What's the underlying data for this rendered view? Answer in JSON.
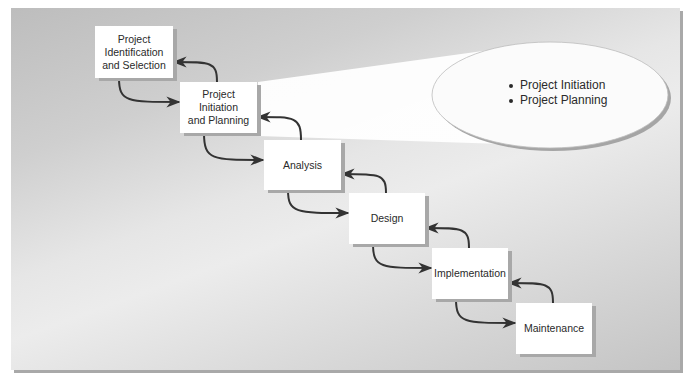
{
  "diagram": {
    "phases": [
      {
        "id": "p1",
        "label": "Project\nIdentification\nand Selection",
        "x": 95,
        "y": 26,
        "w": 78,
        "h": 52
      },
      {
        "id": "p2",
        "label": "Project\nInitiation\nand Planning",
        "x": 180,
        "y": 82,
        "w": 77,
        "h": 51
      },
      {
        "id": "p3",
        "label": "Analysis",
        "x": 264,
        "y": 140,
        "w": 77,
        "h": 50
      },
      {
        "id": "p4",
        "label": "Design",
        "x": 349,
        "y": 193,
        "w": 76,
        "h": 51
      },
      {
        "id": "p5",
        "label": "Implementation",
        "x": 432,
        "y": 248,
        "w": 76,
        "h": 51
      },
      {
        "id": "p6",
        "label": "Maintenance",
        "x": 516,
        "y": 303,
        "w": 76,
        "h": 51
      }
    ],
    "arrows": [
      {
        "from": "p1",
        "to": "p2",
        "direction": "forward"
      },
      {
        "from": "p2",
        "to": "p1",
        "direction": "backward"
      },
      {
        "from": "p2",
        "to": "p3",
        "direction": "forward"
      },
      {
        "from": "p3",
        "to": "p2",
        "direction": "backward"
      },
      {
        "from": "p3",
        "to": "p4",
        "direction": "forward"
      },
      {
        "from": "p4",
        "to": "p3",
        "direction": "backward"
      },
      {
        "from": "p4",
        "to": "p5",
        "direction": "forward"
      },
      {
        "from": "p5",
        "to": "p4",
        "direction": "backward"
      },
      {
        "from": "p5",
        "to": "p6",
        "direction": "forward"
      },
      {
        "from": "p6",
        "to": "p5",
        "direction": "backward"
      }
    ],
    "callout": {
      "attached_to": "p2",
      "items": [
        "Project Initiation",
        "Project Planning"
      ]
    },
    "colors": {
      "arrow": "#333333",
      "box": "#ffffff",
      "box_shadow": "#a8a8a8",
      "panel_shadow": "#a9a9a9"
    }
  }
}
